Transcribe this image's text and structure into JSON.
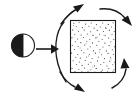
{
  "figure": {
    "canvas": {
      "width": 139,
      "height": 98,
      "background": "#ffffff"
    },
    "ink_color": "#1a1a1a",
    "stipple_color": "#3a3a3a",
    "elements": {
      "source_circle": {
        "label": "half-filled circle",
        "center_x": 23,
        "center_y": 45.5,
        "radius": 11.5,
        "left_half_fill": "#1a1a1a",
        "right_half_fill": "#ffffff",
        "outline": "#1a1a1a"
      },
      "input_arrow": {
        "label": "straight arrow pointing right",
        "from_x": 36,
        "from_y": 49,
        "to_x": 58,
        "to_y": 49,
        "direction": "right"
      },
      "stippled_square": {
        "label": "stippled square region",
        "x": 70,
        "y": 20,
        "width": 46,
        "height": 53,
        "fill": "#ffffff",
        "outline": "#1a1a1a",
        "texture": "random stipple dots",
        "dot_count": 150
      },
      "circulating_arrows": [
        {
          "name": "top-left-arrow",
          "direction": "up-right",
          "position": "upper-left of square"
        },
        {
          "name": "top-right-arrow",
          "direction": "down-right",
          "position": "upper-right of square"
        },
        {
          "name": "bottom-right-arrow",
          "direction": "up-left",
          "position": "lower-right of square"
        },
        {
          "name": "bottom-left-arrow",
          "direction": "down-right",
          "position": "lower-left of square"
        }
      ],
      "left_arc": {
        "label": "left connecting arc",
        "position": "left of square, behind input arrow"
      }
    }
  }
}
